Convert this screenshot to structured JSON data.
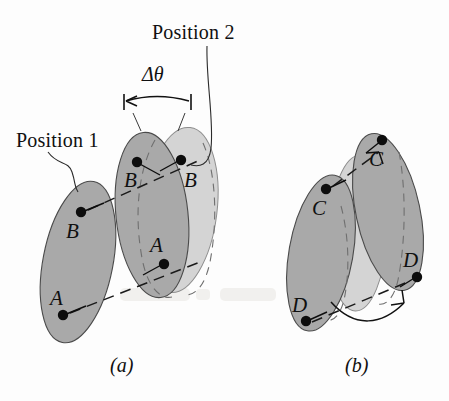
{
  "figure": {
    "type": "technical-illustration",
    "background_color": "#fdfdfd",
    "colors": {
      "body_dark_fill": "#a9a9a9",
      "body_light_fill": "#d4d4d4",
      "outline_stroke": "#4a4a4a",
      "dashed_stroke": "#1a1a1a",
      "label_text": "#101010"
    },
    "annotations": {
      "position_1": "Position 1",
      "position_2": "Position 2",
      "delta_theta": "Δθ"
    },
    "captions": {
      "a": "(a)",
      "b": "(b)"
    },
    "panel_a": {
      "caption": "(a)",
      "bodies": [
        {
          "name": "position-1-body",
          "shade": "dark"
        },
        {
          "name": "position-2-body-overlap",
          "shade": "dark"
        },
        {
          "name": "position-2-body-ghost",
          "shade": "light"
        }
      ],
      "point_labels": [
        {
          "label": "B",
          "body": "position-1-body"
        },
        {
          "label": "A",
          "body": "position-1-body"
        },
        {
          "label": "B",
          "body": "position-2-body-overlap"
        },
        {
          "label": "A",
          "body": "position-2-body-overlap"
        },
        {
          "label": "B",
          "body": "position-2-body-ghost"
        }
      ]
    },
    "panel_b": {
      "caption": "(b)",
      "bodies": [
        {
          "name": "position-1-body",
          "shade": "dark"
        },
        {
          "name": "intermediate-body",
          "shade": "light"
        },
        {
          "name": "position-2-body",
          "shade": "dark"
        }
      ],
      "point_labels": [
        {
          "label": "C",
          "body": "position-1-body"
        },
        {
          "label": "D",
          "body": "position-1-body"
        },
        {
          "label": "C",
          "body": "position-2-body"
        },
        {
          "label": "D",
          "body": "position-2-body"
        }
      ]
    }
  }
}
